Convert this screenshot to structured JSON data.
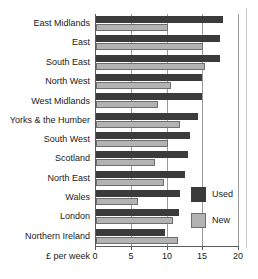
{
  "chart_data": {
    "type": "bar",
    "orientation": "horizontal",
    "title": "",
    "subtitle": "",
    "xlabel": "£ per week",
    "ylabel": "",
    "xlim": [
      0,
      20
    ],
    "xticks": [
      0,
      5,
      10,
      15,
      20
    ],
    "xtick_labels": [
      "0",
      "5",
      "10",
      "15",
      "20"
    ],
    "grid": true,
    "grid_axis": "x",
    "legend_position": "right-inside",
    "categories": [
      "East Midlands",
      "East",
      "South East",
      "North West",
      "West Midlands",
      "Yorks & the Humber",
      "South West",
      "Scotland",
      "North East",
      "Wales",
      "London",
      "Northern Ireland"
    ],
    "series": [
      {
        "name": "Used",
        "color": "#3b3b3b",
        "values": [
          17.8,
          17.3,
          17.4,
          14.8,
          14.8,
          14.3,
          13.1,
          12.9,
          12.4,
          11.8,
          11.6,
          9.6
        ]
      },
      {
        "name": "New",
        "color": "#b3b3b3",
        "values": [
          10.0,
          15.0,
          15.2,
          10.5,
          8.7,
          11.7,
          10.0,
          8.2,
          9.5,
          5.9,
          10.8,
          11.4
        ]
      }
    ]
  },
  "legend": {
    "items": [
      {
        "label": "Used",
        "swatch": "used"
      },
      {
        "label": "New",
        "swatch": "new"
      }
    ]
  },
  "axis": {
    "x_title": "£ per week"
  }
}
